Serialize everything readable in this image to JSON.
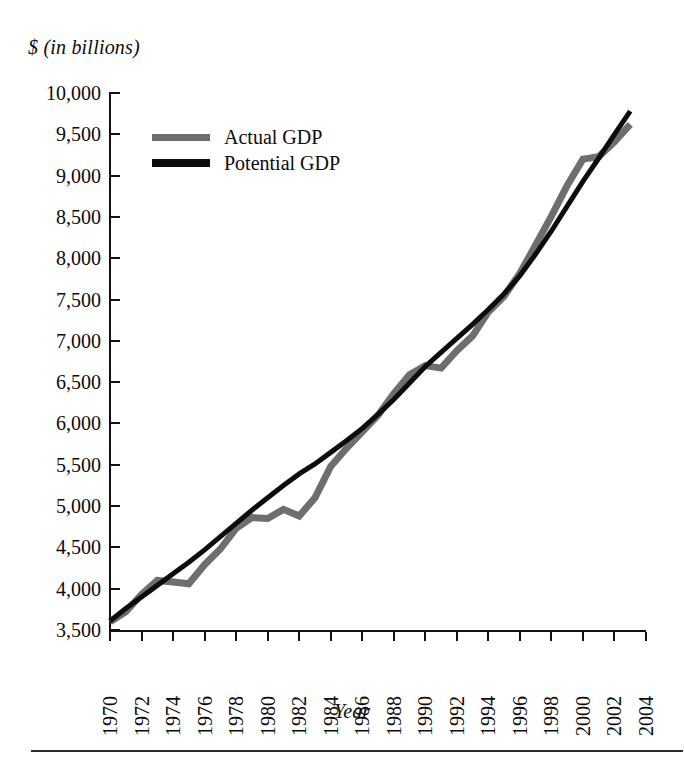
{
  "figure": {
    "y_axis_caption": "$ (in billions)",
    "x_axis_caption": "Year"
  },
  "legend": {
    "items": [
      {
        "label": "Actual GDP",
        "color": "#6e6e6e"
      },
      {
        "label": "Potential GDP",
        "color": "#0d0d0d"
      }
    ]
  },
  "chart_data": {
    "type": "line",
    "title": "",
    "subtitle": "",
    "xlabel": "Year",
    "ylabel": "$ (in billions)",
    "xlim": [
      1970,
      2004
    ],
    "ylim": [
      3500,
      10000
    ],
    "grid": false,
    "legend_position": "inside-top-left",
    "ytick_labels": [
      "10,000",
      "9,500",
      "9,000",
      "8,500",
      "8,000",
      "7,500",
      "7,000",
      "6,500",
      "6,000",
      "5,500",
      "5,000",
      "4,500",
      "4,000",
      "3,500"
    ],
    "ytick_values": [
      10000,
      9500,
      9000,
      8500,
      8000,
      7500,
      7000,
      6500,
      6000,
      5500,
      5000,
      4500,
      4000,
      3500
    ],
    "xtick_labels": [
      "1970",
      "1972",
      "1974",
      "1976",
      "1978",
      "1980",
      "1982",
      "1984",
      "1986",
      "1988",
      "1990",
      "1992",
      "1994",
      "1996",
      "1998",
      "2000",
      "2002",
      "2004"
    ],
    "xtick_values": [
      1970,
      1972,
      1974,
      1976,
      1978,
      1980,
      1982,
      1984,
      1986,
      1988,
      1990,
      1992,
      1994,
      1996,
      1998,
      2000,
      2002,
      2004
    ],
    "x": [
      1970,
      1971,
      1972,
      1973,
      1974,
      1975,
      1976,
      1977,
      1978,
      1979,
      1980,
      1981,
      1982,
      1983,
      1984,
      1985,
      1986,
      1987,
      1988,
      1989,
      1990,
      1991,
      1992,
      1993,
      1994,
      1995,
      1996,
      1997,
      1998,
      1999,
      2000,
      2001,
      2002,
      2003
    ],
    "series": [
      {
        "name": "Actual GDP",
        "color": "#6e6e6e",
        "values": [
          3600,
          3720,
          3930,
          4100,
          4080,
          4060,
          4290,
          4480,
          4730,
          4860,
          4850,
          4960,
          4880,
          5100,
          5480,
          5700,
          5900,
          6100,
          6360,
          6590,
          6700,
          6670,
          6880,
          7060,
          7350,
          7540,
          7820,
          8160,
          8510,
          8880,
          9200,
          9230,
          9410,
          9620
        ]
      },
      {
        "name": "Potential GDP",
        "color": "#0d0d0d",
        "values": [
          3610,
          3760,
          3900,
          4040,
          4180,
          4320,
          4470,
          4630,
          4790,
          4950,
          5100,
          5250,
          5390,
          5510,
          5650,
          5790,
          5940,
          6110,
          6290,
          6490,
          6690,
          6860,
          7030,
          7200,
          7380,
          7570,
          7790,
          8050,
          8330,
          8630,
          8930,
          9210,
          9500,
          9780
        ]
      }
    ]
  }
}
